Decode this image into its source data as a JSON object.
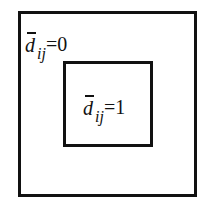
{
  "diagram": {
    "outer_region": {
      "variable": "d",
      "overbar": true,
      "subscript": "ij",
      "relation": "=0"
    },
    "inner_region": {
      "variable": "d",
      "overbar": true,
      "subscript": "ij",
      "relation": "=1"
    },
    "colors": {
      "stroke": "#111111",
      "background": "#ffffff"
    }
  }
}
